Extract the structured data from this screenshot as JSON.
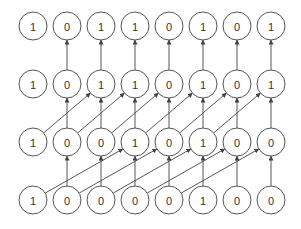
{
  "diagram": {
    "type": "parallel-prefix-network",
    "columns_x": [
      33,
      67,
      101,
      135,
      169,
      203,
      237,
      271
    ],
    "rows_y": [
      26,
      84,
      142,
      200
    ],
    "radius": 14,
    "colors": {
      "stroke": "#555555",
      "text": "#333333",
      "edge": "#444444",
      "background": "#ffffff"
    },
    "rows": [
      {
        "name": "row-output",
        "values": [
          "1",
          "0",
          "1",
          "1",
          "0",
          "1",
          "0",
          "1"
        ]
      },
      {
        "name": "row-level-2",
        "values": [
          "1",
          "0",
          "1",
          "1",
          "0",
          "1",
          "0",
          "1"
        ]
      },
      {
        "name": "row-level-1",
        "values": [
          "1",
          "0",
          "0",
          "1",
          "0",
          "1",
          "0",
          "0"
        ]
      },
      {
        "name": "row-input",
        "values": [
          "1",
          "0",
          "0",
          "0",
          "0",
          "1",
          "0",
          "0"
        ]
      }
    ],
    "stages": [
      {
        "from_row": 1,
        "to_row": 0,
        "vertical_cols": [
          1,
          2,
          3,
          4,
          5,
          6,
          7
        ],
        "diagonal_shift": 0
      },
      {
        "from_row": 2,
        "to_row": 1,
        "vertical_cols": [
          1,
          2,
          3,
          4,
          5,
          6,
          7
        ],
        "diagonal_shift": 2
      },
      {
        "from_row": 3,
        "to_row": 2,
        "vertical_cols": [
          1,
          2,
          3,
          4,
          5,
          6,
          7
        ],
        "diagonal_shift": 3
      }
    ]
  }
}
